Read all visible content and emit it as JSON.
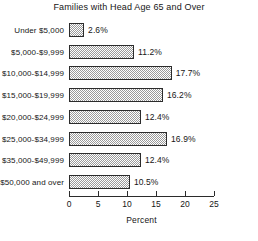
{
  "chart_data": {
    "type": "bar",
    "orientation": "horizontal",
    "title": "Families with Head Age 65 and Over",
    "xlabel": "Percent",
    "ylabel": "",
    "xlim": [
      0,
      25
    ],
    "xticks": [
      0,
      5,
      10,
      15,
      20,
      25
    ],
    "xtick_labels": [
      "0",
      "5",
      "10",
      "15",
      "20",
      "25"
    ],
    "grid": false,
    "legend": null,
    "categories": [
      "Under $5,000",
      "$5,000-$9,999",
      "$10,000-$14,999",
      "$15,000-$19,999",
      "$20,000-$24,999",
      "$25,000-$34,999",
      "$35,000-$49,999",
      "$50,000 and over"
    ],
    "values": [
      2.6,
      11.2,
      17.7,
      16.2,
      12.4,
      16.9,
      12.4,
      10.5
    ],
    "data_labels": [
      "2.6%",
      "11.2%",
      "17.7%",
      "16.2%",
      "12.4%",
      "16.9%",
      "12.4%",
      "10.5%"
    ],
    "bar_fill": "#9a9a9a",
    "bar_edge": "#2b2b2b",
    "text_color": "#161616",
    "background": "#ffffff"
  }
}
